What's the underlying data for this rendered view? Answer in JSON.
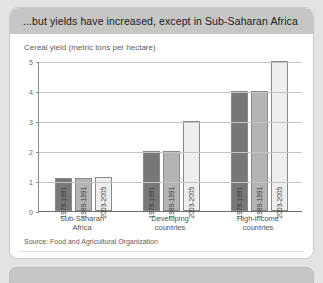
{
  "card": {
    "title": "...but yields have increased, except in Sub-Saharan Africa",
    "subtitle": "Cereal yield (metric tons per hectare)",
    "source": "Source: Food and Agricultural Organization"
  },
  "chart_data": {
    "type": "bar",
    "title": "Cereal yield (metric tons per hectare)",
    "xlabel": "",
    "ylabel": "",
    "ylim": [
      0,
      5
    ],
    "yticks": [
      "0",
      "1",
      "2",
      "3",
      "4",
      "5"
    ],
    "grid": true,
    "legend_position": "in-bar-labels",
    "categories": [
      "Sub-Saharan Africa",
      "Developing countries",
      "High-income countries"
    ],
    "series": [
      {
        "name": "1979-1981",
        "values": [
          1.1,
          2.0,
          4.0
        ],
        "color": "#77777a"
      },
      {
        "name": "1989-1991",
        "values": [
          1.1,
          2.0,
          4.0
        ],
        "color": "#b4b4b4"
      },
      {
        "name": "2003-2005",
        "values": [
          1.15,
          3.0,
          5.0
        ],
        "color": "#eeeeee"
      }
    ],
    "bar_labels": [
      [
        "1979-1981",
        "1989-1991",
        "2003-2005"
      ],
      [
        "1979-1981",
        "1989-1991",
        "2003-2005"
      ],
      [
        "1979-1981",
        "1989-1991",
        "2003-2005"
      ]
    ]
  }
}
